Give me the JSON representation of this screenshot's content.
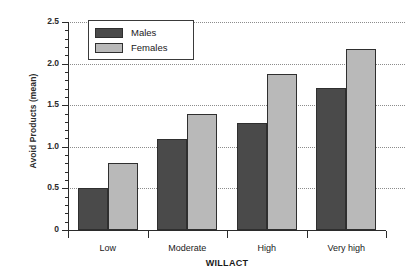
{
  "chart_data": {
    "type": "bar",
    "title": "",
    "xlabel": "WILLACT",
    "ylabel": "Avoid Products (mean)",
    "categories": [
      "Low",
      "Moderate",
      "High",
      "Very high"
    ],
    "series": [
      {
        "name": "Males",
        "color": "#4a4a4a",
        "values": [
          0.51,
          1.09,
          1.29,
          1.71
        ]
      },
      {
        "name": "Females",
        "color": "#b9b9b9",
        "values": [
          0.8,
          1.4,
          1.88,
          2.17
        ]
      }
    ],
    "ylim": [
      0,
      2.5
    ],
    "yticks": [
      0,
      0.5,
      1.0,
      1.5,
      2.0,
      2.5
    ],
    "yticklabels": [
      "0",
      "0.5",
      "1.0",
      "1.5",
      "2.0",
      "2.5"
    ],
    "yminor_step": 0.1,
    "grid": "horizontal-dotted",
    "legend_position": "upper-left-inside"
  },
  "legend": {
    "entries": [
      {
        "label": "Males"
      },
      {
        "label": "Females"
      }
    ]
  }
}
